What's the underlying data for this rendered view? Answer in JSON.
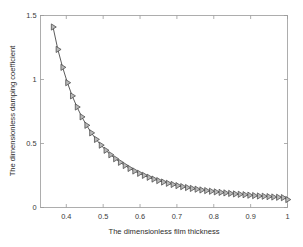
{
  "chart_data": {
    "type": "line",
    "title": "",
    "xlabel": "The dimensionless film thickness",
    "ylabel": "The dimensionless damping coefficient",
    "xlim": [
      0.33,
      1.0
    ],
    "ylim": [
      0,
      1.5
    ],
    "xticks": [
      0.4,
      0.5,
      0.6,
      0.7,
      0.8,
      0.9,
      1
    ],
    "xtick_labels": [
      "0.4",
      "0.5",
      "0.6",
      "0.7",
      "0.8",
      "0.9",
      "1"
    ],
    "yticks": [
      0,
      0.5,
      1,
      1.5
    ],
    "ytick_labels": [
      "0",
      "0.5",
      "1",
      "1.5"
    ],
    "grid": false,
    "legend": null,
    "marker": "right-triangle",
    "line_color": "#4a4a4a",
    "marker_fill": "#b9b9b9",
    "marker_edge": "#3f3f3f",
    "series": [
      {
        "name": "damping coefficient",
        "x": [
          0.364,
          0.377,
          0.39,
          0.403,
          0.416,
          0.429,
          0.442,
          0.455,
          0.468,
          0.481,
          0.494,
          0.507,
          0.52,
          0.533,
          0.546,
          0.559,
          0.572,
          0.585,
          0.598,
          0.611,
          0.624,
          0.637,
          0.65,
          0.663,
          0.676,
          0.689,
          0.702,
          0.715,
          0.728,
          0.741,
          0.754,
          0.767,
          0.78,
          0.793,
          0.806,
          0.819,
          0.832,
          0.845,
          0.858,
          0.871,
          0.884,
          0.897,
          0.91,
          0.923,
          0.936,
          0.949,
          0.962,
          0.975,
          0.988,
          1.0
        ],
        "y": [
          1.41,
          1.235,
          1.095,
          0.975,
          0.872,
          0.785,
          0.708,
          0.642,
          0.583,
          0.532,
          0.487,
          0.447,
          0.412,
          0.381,
          0.353,
          0.328,
          0.305,
          0.285,
          0.267,
          0.251,
          0.236,
          0.222,
          0.21,
          0.199,
          0.189,
          0.18,
          0.171,
          0.163,
          0.156,
          0.149,
          0.143,
          0.137,
          0.132,
          0.127,
          0.122,
          0.118,
          0.114,
          0.11,
          0.106,
          0.103,
          0.1,
          0.096,
          0.093,
          0.09,
          0.088,
          0.085,
          0.082,
          0.08,
          0.077,
          0.062
        ]
      }
    ]
  },
  "figure": {
    "background_color": "#ffffff",
    "axis_color": "#9a9a9a",
    "text_color": "#2b2b2b"
  }
}
